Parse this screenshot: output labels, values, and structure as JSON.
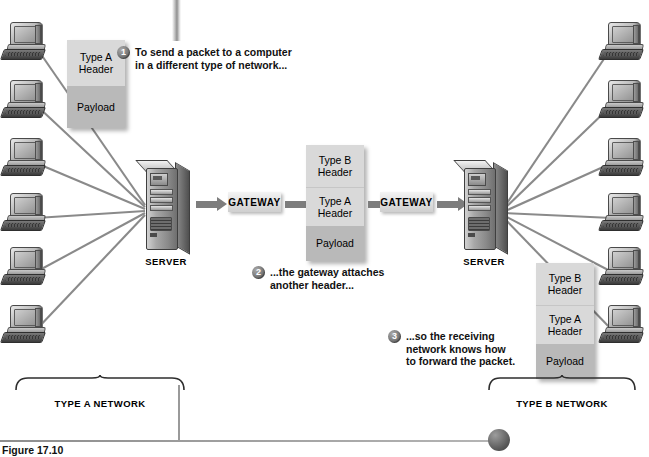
{
  "figure": {
    "caption": "Figure 17.10"
  },
  "left_network": {
    "label": "TYPE A NETWORK",
    "server_label": "SERVER",
    "computer_count": 6,
    "computer_icon": "desktop-computer-icon"
  },
  "right_network": {
    "label": "TYPE B NETWORK",
    "server_label": "SERVER",
    "computer_count": 6,
    "computer_icon": "desktop-computer-icon"
  },
  "gateways": [
    {
      "label": "GATEWAY"
    },
    {
      "label": "GATEWAY"
    }
  ],
  "packets": {
    "source": {
      "name": "type-a-packet",
      "segments": [
        {
          "label": "Type A\nHeader",
          "shade": "light"
        },
        {
          "label": "Payload",
          "shade": "dark"
        }
      ]
    },
    "encapsulated": {
      "name": "type-b-encapsulated-packet",
      "segments": [
        {
          "label": "Type B\nHeader",
          "shade": "light"
        },
        {
          "label": "Type A\nHeader",
          "shade": "light"
        },
        {
          "label": "Payload",
          "shade": "dark"
        }
      ]
    },
    "delivered": {
      "name": "delivered-packet",
      "segments": [
        {
          "label": "Type B\nHeader",
          "shade": "light"
        },
        {
          "label": "Type A\nHeader",
          "shade": "light"
        },
        {
          "label": "Payload",
          "shade": "dark"
        }
      ]
    }
  },
  "callouts": [
    {
      "number": "1",
      "text": "To send a packet to a computer\nin a different type of network..."
    },
    {
      "number": "2",
      "text": "...the gateway attaches\nanother header..."
    },
    {
      "number": "3",
      "text": "...so the receiving\nnetwork knows how\nto forward the packet."
    }
  ],
  "colors": {
    "packet_light": "#d9d9d9",
    "packet_dark": "#b9b9b9",
    "arrow": "#7d7d7d",
    "line": "#8a8a8a",
    "text": "#111111"
  }
}
